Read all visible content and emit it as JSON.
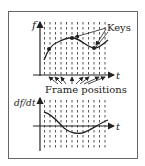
{
  "figure": {
    "top_plot": {
      "y_axis_label": "f",
      "x_axis_label": "t",
      "annotation": "Keys",
      "bottom_annotation": "Frame positions"
    },
    "bottom_plot": {
      "y_axis_label": "df/dt",
      "x_axis_label": "t"
    }
  },
  "colors": {
    "line": "#222222",
    "grid": "#555555",
    "border": "#666666"
  }
}
